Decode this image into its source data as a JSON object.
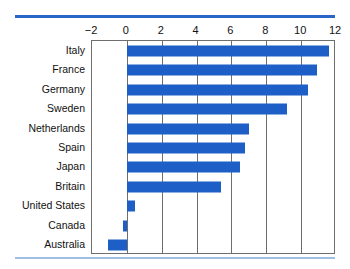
{
  "figure": {
    "accent_color": "#2a66c8",
    "bar_color": "#1d5fc6",
    "frame_color": "#6e6e6e",
    "background": "#ffffff",
    "top_rule": "top-rule",
    "bottom_rule": "bottom-rule"
  },
  "chart_data": {
    "type": "bar",
    "orientation": "horizontal",
    "title": "",
    "subtitle": "",
    "xlabel": "",
    "ylabel": "",
    "categories": [
      "Italy",
      "France",
      "Germany",
      "Sweden",
      "Netherlands",
      "Spain",
      "Japan",
      "Britain",
      "United States",
      "Canada",
      "Australia"
    ],
    "values": [
      11.6,
      10.9,
      10.4,
      9.2,
      7.0,
      6.8,
      6.5,
      5.4,
      0.45,
      -0.2,
      -1.1
    ],
    "xlim": [
      -2,
      12
    ],
    "xticks": [
      -2,
      0,
      2,
      4,
      6,
      8,
      10,
      12
    ],
    "xticklabels": [
      "−2",
      "0",
      "2",
      "4",
      "6",
      "8",
      "10",
      "12"
    ],
    "grid": true,
    "grid_axis": "x",
    "legend": false,
    "legend_position": "none",
    "zero_line": 0,
    "annotations": []
  }
}
